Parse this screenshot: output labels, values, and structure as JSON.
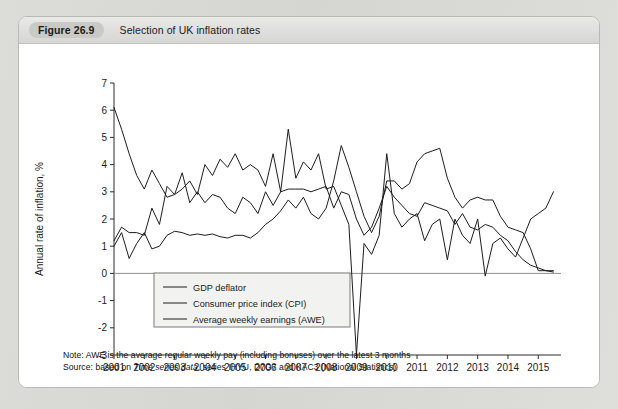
{
  "figure": {
    "tag": "Figure 26.9",
    "title": "Selection of UK inflation rates"
  },
  "notes": {
    "note_prefix": "Note: AWE is the average regular weekly pay (including bonuses) over the latest 3 months",
    "source_prefix": "Source: based on ",
    "source_italic": "Time series data",
    "source_suffix": ", series IHYU, D7G7 and KAC3 (National Statistics)"
  },
  "chart_data": {
    "type": "line",
    "title": "Selection of UK inflation rates",
    "xlabel": "",
    "ylabel": "Annual rate of inflation, %",
    "ylim": [
      -3,
      7
    ],
    "xlim": [
      2001,
      2015.75
    ],
    "ytick_labels": [
      "7",
      "6",
      "5",
      "4",
      "3",
      "2",
      "1",
      "0",
      "-1",
      "-2",
      "-3"
    ],
    "ytick_values": [
      7,
      6,
      5,
      4,
      3,
      2,
      1,
      0,
      -1,
      -2,
      -3
    ],
    "xtick_labels": [
      "2001",
      "2002",
      "2003",
      "2004",
      "2005",
      "2006",
      "2007",
      "2008",
      "2009",
      "2010",
      "2011",
      "2012",
      "2013",
      "2014",
      "2015"
    ],
    "xtick_values": [
      2001,
      2002,
      2003,
      2004,
      2005,
      2006,
      2007,
      2008,
      2009,
      2010,
      2011,
      2012,
      2013,
      2014,
      2015
    ],
    "grid": false,
    "legend_position": "lower-left-inside",
    "zero_line": true,
    "x": [
      2001.0,
      2001.25,
      2001.5,
      2001.75,
      2002.0,
      2002.25,
      2002.5,
      2002.75,
      2003.0,
      2003.25,
      2003.5,
      2003.75,
      2004.0,
      2004.25,
      2004.5,
      2004.75,
      2005.0,
      2005.25,
      2005.5,
      2005.75,
      2006.0,
      2006.25,
      2006.5,
      2006.75,
      2007.0,
      2007.25,
      2007.5,
      2007.75,
      2008.0,
      2008.25,
      2008.5,
      2008.75,
      2009.0,
      2009.25,
      2009.5,
      2009.75,
      2010.0,
      2010.25,
      2010.5,
      2010.75,
      2011.0,
      2011.25,
      2011.5,
      2011.75,
      2012.0,
      2012.25,
      2012.5,
      2012.75,
      2013.0,
      2013.25,
      2013.5,
      2013.75,
      2014.0,
      2014.25,
      2014.5,
      2014.75,
      2015.0,
      2015.25,
      2015.5
    ],
    "series": [
      {
        "name": "GDP deflator",
        "values": [
          1.2,
          1.7,
          1.5,
          1.5,
          1.4,
          2.4,
          1.8,
          3.2,
          2.9,
          3.7,
          2.6,
          3.0,
          2.6,
          2.9,
          2.8,
          2.4,
          2.2,
          2.8,
          2.6,
          2.2,
          3.0,
          2.5,
          3.0,
          3.1,
          3.1,
          3.1,
          3.0,
          3.1,
          3.2,
          2.4,
          3.0,
          2.9,
          2.0,
          1.4,
          1.7,
          2.4,
          3.2,
          2.8,
          2.5,
          2.2,
          2.1,
          2.6,
          2.5,
          2.4,
          2.3,
          1.8,
          2.2,
          1.7,
          1.6,
          1.8,
          1.7,
          1.4,
          1.2,
          0.8,
          0.5,
          0.3,
          0.2,
          0.1,
          0.1
        ]
      },
      {
        "name": "Consumer price index (CPI)",
        "values": [
          1.0,
          1.5,
          0.55,
          1.1,
          1.5,
          0.9,
          1.0,
          1.4,
          1.55,
          1.5,
          1.4,
          1.45,
          1.4,
          1.45,
          1.35,
          1.3,
          1.4,
          1.4,
          1.3,
          1.5,
          1.8,
          2.0,
          2.3,
          2.7,
          2.4,
          2.8,
          2.2,
          2.0,
          2.4,
          3.4,
          4.7,
          3.9,
          3.0,
          2.1,
          1.5,
          2.1,
          3.4,
          3.4,
          3.1,
          3.3,
          4.1,
          4.4,
          4.5,
          4.6,
          3.5,
          2.8,
          2.4,
          2.7,
          2.8,
          2.7,
          2.7,
          2.1,
          1.7,
          1.6,
          1.5,
          0.9,
          0.1,
          0.1,
          0.05
        ]
      },
      {
        "name": "Average weekly earnings (AWE)",
        "values": [
          6.1,
          5.3,
          4.4,
          3.6,
          3.1,
          3.8,
          3.3,
          2.8,
          2.9,
          3.1,
          3.4,
          2.9,
          4.0,
          3.6,
          4.2,
          3.9,
          4.4,
          3.8,
          4.0,
          3.8,
          3.2,
          4.4,
          3.0,
          5.3,
          3.5,
          4.1,
          3.8,
          4.4,
          3.1,
          3.2,
          2.5,
          1.8,
          -3.0,
          1.1,
          0.7,
          1.4,
          4.4,
          2.2,
          1.7,
          2.0,
          2.2,
          1.2,
          1.8,
          2.0,
          0.5,
          2.0,
          1.4,
          1.1,
          2.0,
          -0.1,
          1.1,
          1.3,
          0.9,
          0.6,
          1.3,
          2.0,
          2.2,
          2.4,
          3.0
        ]
      }
    ]
  },
  "legend": {
    "items": [
      {
        "label": "GDP deflator"
      },
      {
        "label": "Consumer price index (CPI)"
      },
      {
        "label": "Average weekly earnings (AWE)"
      }
    ]
  },
  "colors": {
    "line": "#1c1c1c",
    "axis": "#2b2b2b",
    "zero_line": "#8e8e8e",
    "card_bg": "#ffffff",
    "page_bg": "#d8d8d4",
    "caption_bg": "#dedede",
    "tag_bg": "#c9c9c6"
  }
}
